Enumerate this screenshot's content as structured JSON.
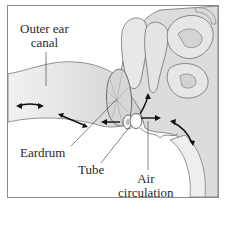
{
  "diagram": {
    "labels": {
      "outer_ear_canal_line1": "Outer ear",
      "outer_ear_canal_line2": "canal",
      "eardrum": "Eardrum",
      "tube": "Tube",
      "air_circulation_line1": "Air",
      "air_circulation_line2": "circulation"
    },
    "colors": {
      "frame": "#8a8a8a",
      "tissue_fill": "#d9d9d9",
      "tissue_light": "#ececec",
      "outline": "#6e6e6e",
      "arrow": "#111111",
      "label_text": "#2b2b2b"
    }
  }
}
